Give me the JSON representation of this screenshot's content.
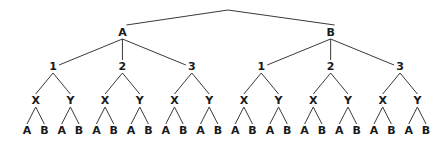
{
  "diagram": {
    "type": "tree",
    "root": {
      "label": ""
    },
    "level1": [
      "A",
      "B"
    ],
    "level2": [
      "1",
      "2",
      "3"
    ],
    "level3": [
      "X",
      "Y"
    ],
    "level4": [
      "A",
      "B"
    ],
    "colors": {
      "line": "#3a3a3a",
      "text": "#1a1a1a",
      "background": "#ffffff"
    }
  }
}
